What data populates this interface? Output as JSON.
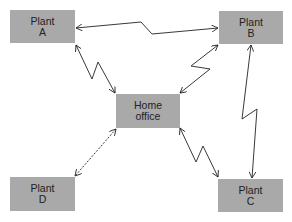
{
  "diagram": {
    "colors": {
      "node_fill": "#a9a9a9",
      "node_text": "#222222",
      "link_stroke": "#222222",
      "background": "#ffffff"
    },
    "nodes": {
      "plant_a": {
        "line1": "Plant",
        "line2": "A"
      },
      "plant_b": {
        "line1": "Plant",
        "line2": "B"
      },
      "plant_c": {
        "line1": "Plant",
        "line2": "C"
      },
      "plant_d": {
        "line1": "Plant",
        "line2": "D"
      },
      "home_office": {
        "line1": "Home",
        "line2": "office"
      }
    },
    "links": [
      {
        "from": "Plant A",
        "to": "Plant B",
        "style": "zigzag",
        "direction": "bidirectional"
      },
      {
        "from": "Plant A",
        "to": "Home office",
        "style": "zigzag",
        "direction": "bidirectional"
      },
      {
        "from": "Plant B",
        "to": "Home office",
        "style": "zigzag",
        "direction": "bidirectional"
      },
      {
        "from": "Plant B",
        "to": "Plant C",
        "style": "zigzag",
        "direction": "bidirectional"
      },
      {
        "from": "Home office",
        "to": "Plant C",
        "style": "zigzag",
        "direction": "bidirectional"
      },
      {
        "from": "Home office",
        "to": "Plant D",
        "style": "dashed",
        "direction": "bidirectional"
      }
    ]
  }
}
